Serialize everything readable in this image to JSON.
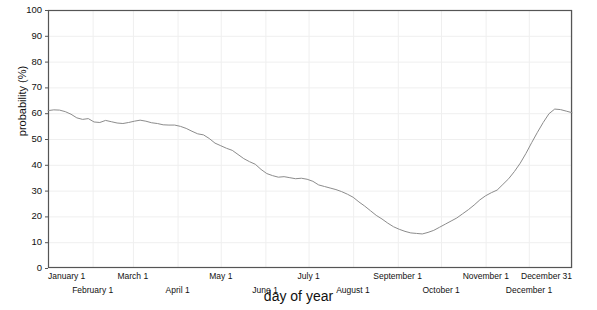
{
  "chart_data": {
    "type": "line",
    "title": "",
    "xlabel": "day of year",
    "ylabel": "probability (%)",
    "ylim": [
      0,
      100
    ],
    "xlim": [
      1,
      365
    ],
    "grid": true,
    "legend": null,
    "y_ticks": [
      "0",
      "10",
      "20",
      "30",
      "40",
      "50",
      "60",
      "70",
      "80",
      "90",
      "100"
    ],
    "y_tick_values": [
      0,
      10,
      20,
      30,
      40,
      50,
      60,
      70,
      80,
      90,
      100
    ],
    "x_ticks_upper": [
      "January 1",
      "March 1",
      "May 1",
      "July 1",
      "September 1",
      "November 1",
      "December 31"
    ],
    "x_ticks_upper_days": [
      1,
      60,
      121,
      182,
      244,
      305,
      365
    ],
    "x_ticks_lower": [
      "February 1",
      "April 1",
      "June 1",
      "August 1",
      "October 1",
      "December 1"
    ],
    "x_ticks_lower_days": [
      32,
      91,
      152,
      213,
      274,
      335
    ],
    "line_color": "#8c8c8c",
    "axis_color": "#555555",
    "grid_color": "#efefef",
    "background": "#ffffff",
    "series": [
      {
        "name": "probability",
        "x": [
          1,
          5,
          9,
          13,
          17,
          21,
          25,
          29,
          33,
          37,
          41,
          45,
          49,
          53,
          57,
          61,
          65,
          69,
          73,
          77,
          81,
          85,
          89,
          93,
          97,
          101,
          105,
          109,
          113,
          117,
          121,
          125,
          129,
          133,
          137,
          141,
          145,
          149,
          153,
          157,
          161,
          165,
          169,
          173,
          177,
          181,
          185,
          189,
          193,
          197,
          201,
          205,
          209,
          213,
          217,
          221,
          225,
          229,
          233,
          237,
          241,
          245,
          249,
          253,
          257,
          261,
          265,
          269,
          273,
          277,
          281,
          285,
          289,
          293,
          297,
          301,
          305,
          309,
          313,
          317,
          321,
          325,
          329,
          333,
          337,
          341,
          345,
          349,
          353,
          357,
          361,
          365
        ],
        "y": [
          61.0,
          61.3,
          61.2,
          60.6,
          59.6,
          58.2,
          57.6,
          57.9,
          56.6,
          56.4,
          57.2,
          56.7,
          56.2,
          56.0,
          56.4,
          56.9,
          57.3,
          56.9,
          56.3,
          56.0,
          55.5,
          55.4,
          55.4,
          54.9,
          54.1,
          53.0,
          52.0,
          51.6,
          50.2,
          48.4,
          47.4,
          46.4,
          45.6,
          44.0,
          42.4,
          41.2,
          40.2,
          38.2,
          36.6,
          35.8,
          35.2,
          35.4,
          35.0,
          34.6,
          34.8,
          34.4,
          33.6,
          32.2,
          31.6,
          31.0,
          30.4,
          29.6,
          28.6,
          27.4,
          25.6,
          24.0,
          22.2,
          20.4,
          19.0,
          17.4,
          16.0,
          15.0,
          14.2,
          13.6,
          13.4,
          13.2,
          13.8,
          14.6,
          15.8,
          17.0,
          18.2,
          19.4,
          21.0,
          22.6,
          24.4,
          26.4,
          28.0,
          29.2,
          30.2,
          32.4,
          34.6,
          37.4,
          40.6,
          44.4,
          48.6,
          52.6,
          56.4,
          59.8,
          61.6,
          61.4,
          60.8,
          60.2
        ],
        "min": {
          "value": 13.2,
          "day": 261
        },
        "max": {
          "value": 61.6,
          "day": 353
        }
      }
    ]
  },
  "axes": {
    "plot_left_px": 48,
    "plot_right_px": 572,
    "plot_top_px": 10,
    "plot_bottom_px": 268
  }
}
